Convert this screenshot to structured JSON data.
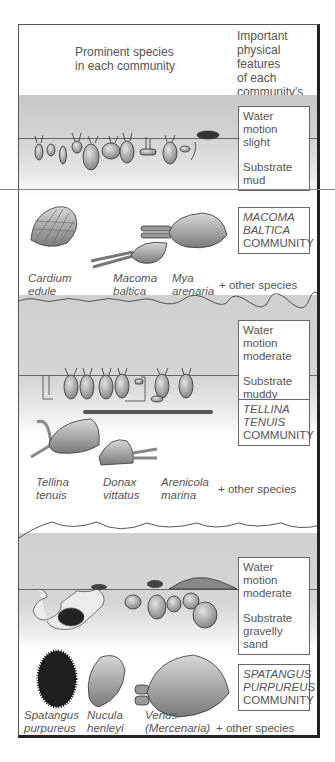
{
  "header": {
    "left_label": [
      "Prominent species",
      "in each community"
    ],
    "right_label": [
      "Important",
      "physical features",
      "of each",
      "community's",
      "habitat"
    ]
  },
  "communities": [
    {
      "name_lines": [
        "MACOMA",
        "BALTICA"
      ],
      "community_word": "COMMUNITY",
      "habitat": {
        "water_motion_label": "Water motion",
        "water_motion_value": "slight",
        "substrate_label": "Substrate",
        "substrate_value": "mud"
      },
      "species": [
        {
          "line1": "Cardium",
          "line2": "edule"
        },
        {
          "line1": "Macoma",
          "line2": "baltica"
        },
        {
          "line1": "Mya",
          "line2": "arenaria"
        }
      ],
      "other": "+ other species"
    },
    {
      "name_lines": [
        "TELLINA",
        "TENUIS"
      ],
      "community_word": "COMMUNITY",
      "habitat": {
        "water_motion_label": "Water motion",
        "water_motion_value": "moderate",
        "substrate_label": "Substrate",
        "substrate_value": "muddy sand"
      },
      "species": [
        {
          "line1": "Tellina",
          "line2": "tenuis"
        },
        {
          "line1": "Donax",
          "line2": "vittatus"
        },
        {
          "line1": "Arenicola",
          "line2": "marina"
        }
      ],
      "other": "+ other species"
    },
    {
      "name_lines": [
        "SPATANGUS",
        "PURPUREUS"
      ],
      "community_word": "COMMUNITY",
      "habitat": {
        "water_motion_label": "Water motion",
        "water_motion_value": "moderate",
        "substrate_label": "Substrate",
        "substrate_value": "gravelly sand"
      },
      "species": [
        {
          "line1": "Spatangus",
          "line2": "purpureus"
        },
        {
          "line1": "Nucula",
          "line2": "henleyi"
        },
        {
          "line1": "Venus",
          "line2": "(Mercenaria)",
          "line3": "fasciatus"
        }
      ],
      "other": "+ other species"
    }
  ],
  "colors": {
    "water": "#d0d0d0",
    "shell": "#9a9a9a",
    "urchin": "#222222",
    "frame": "#222222"
  }
}
